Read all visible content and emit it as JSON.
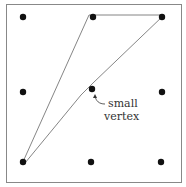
{
  "figure": {
    "frame": {
      "x": 6,
      "y": 4,
      "w": 175,
      "h": 178
    },
    "grid_points": [
      {
        "x": 23,
        "y": 17
      },
      {
        "x": 93,
        "y": 17
      },
      {
        "x": 162,
        "y": 17
      },
      {
        "x": 23,
        "y": 92
      },
      {
        "x": 92,
        "y": 89
      },
      {
        "x": 162,
        "y": 92
      },
      {
        "x": 23,
        "y": 162
      },
      {
        "x": 91,
        "y": 162
      },
      {
        "x": 161,
        "y": 162
      }
    ],
    "polygon": "22,164 89,15 164,15 93,83 81,95 25,163",
    "annotation": {
      "line1": "small",
      "line2": "vertex"
    },
    "colors": {
      "dot": "#111111",
      "stroke": "#777777",
      "frame": "#888888"
    }
  }
}
